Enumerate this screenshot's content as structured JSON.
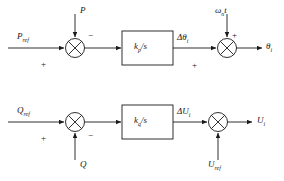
{
  "diagram": {
    "stroke_color": "#1a1a1a",
    "background": "#ffffff",
    "rows": [
      {
        "id": "active-power-channel",
        "input_label": "P",
        "input_sub": "ref",
        "disturbance_label": "P",
        "disturbance_sign": "−",
        "input_sign": "+",
        "block_numerator": "k",
        "block_sub": "p",
        "block_denominator": "/s",
        "block_text": "k_p/s",
        "mid_label": "Δθ",
        "mid_sub": "i",
        "feed_label": "ω",
        "feed_sub": "n",
        "feed_suffix": "t",
        "feed_sign": "+",
        "sum2_sign": "+",
        "output_label": "θ",
        "output_sub": "i"
      },
      {
        "id": "reactive-power-channel",
        "input_label": "Q",
        "input_sub": "ref",
        "disturbance_label": "Q",
        "disturbance_sign": "−",
        "input_sign": "+",
        "block_numerator": "k",
        "block_sub": "q",
        "block_denominator": "/s",
        "block_text": "k_q/s",
        "mid_label": "ΔU",
        "mid_sub": "i",
        "feed_label": "U",
        "feed_sub": "ref",
        "feed_suffix": "",
        "feed_sign": "",
        "sum2_sign": "",
        "output_label": "U",
        "output_sub": "i"
      }
    ],
    "symbols": {
      "sum_junction": "circle-with-x",
      "arrow": "solid-triangle-arrowhead",
      "delta": "Δ",
      "theta": "θ",
      "omega": "ω"
    }
  }
}
